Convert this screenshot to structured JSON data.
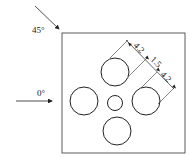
{
  "diagram": {
    "type": "engineering-drawing",
    "labels": {
      "angle_45": "45°",
      "angle_0": "0°",
      "dim_a": "4.2",
      "dim_b": "1.5",
      "dim_c": "4.2"
    },
    "colors": {
      "stroke": "#222222",
      "background": "#ffffff"
    }
  }
}
